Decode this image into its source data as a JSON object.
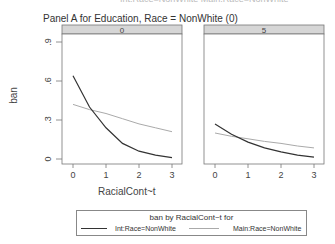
{
  "figure": {
    "cut_title": "Int:Race=NonWhite Main:Race=NonWhite",
    "title": "Panel A for Education, Race = NonWhite (0)",
    "ylabel": "ban",
    "xlabel": "RacialCont~t",
    "panels": [
      {
        "strip": "0"
      },
      {
        "strip": "5"
      }
    ],
    "y_ticks": [
      ".9",
      ".6",
      ".3",
      "0"
    ],
    "x_ticks": [
      "0",
      "1",
      "2",
      "3"
    ]
  },
  "legend": {
    "title": "ban by RacialCont~t for",
    "items": [
      {
        "label": "Int:Race=NonWhite",
        "color": "#333333"
      },
      {
        "label": "Main:Race=NonWhite",
        "color": "#aaaaaa"
      }
    ]
  },
  "chart_data": {
    "type": "line",
    "title": "Panel A for Education, Race = NonWhite (0)",
    "xlabel": "RacialCont~t",
    "ylabel": "ban",
    "ylim": [
      0,
      0.95
    ],
    "xlim": [
      0,
      3
    ],
    "x": [
      0,
      0.5,
      1,
      1.5,
      2,
      2.5,
      3
    ],
    "panels": [
      {
        "strip": "0",
        "series": [
          {
            "name": "Int:Race=NonWhite",
            "values": [
              0.64,
              0.4,
              0.24,
              0.12,
              0.06,
              0.03,
              0.01
            ]
          },
          {
            "name": "Main:Race=NonWhite",
            "values": [
              0.42,
              0.38,
              0.35,
              0.31,
              0.27,
              0.24,
              0.21
            ]
          }
        ]
      },
      {
        "strip": "5",
        "series": [
          {
            "name": "Int:Race=NonWhite",
            "values": [
              0.27,
              0.19,
              0.13,
              0.085,
              0.055,
              0.03,
              0.015
            ]
          },
          {
            "name": "Main:Race=NonWhite",
            "values": [
              0.2,
              0.175,
              0.155,
              0.135,
              0.12,
              0.1,
              0.085
            ]
          }
        ]
      }
    ],
    "legend": {
      "title": "ban by RacialCont~t for",
      "position": "bottom"
    },
    "grid": false
  }
}
